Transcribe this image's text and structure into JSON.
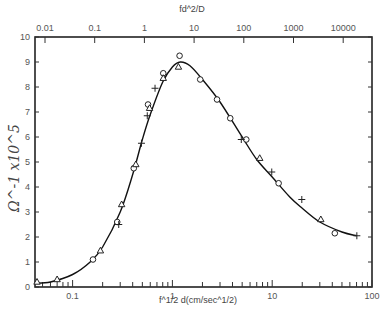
{
  "chart_data": {
    "type": "scatter",
    "title": "",
    "xlabel": "f^1/2 d(cm/sec^1/2)",
    "xlabel_top": "fd^2/D",
    "ylabel": "Ω^-1 x10^5",
    "xscale": "log",
    "xlim": [
      0.042,
      100
    ],
    "ylim": [
      0,
      10
    ],
    "x_ticks_bottom": [
      "0.1",
      "1",
      "10",
      "100"
    ],
    "x_ticks_top": [
      "0.01",
      "0.1",
      "1",
      "10",
      "100",
      "1000",
      "10000"
    ],
    "y_ticks": [
      "0",
      "1",
      "2",
      "3",
      "4",
      "5",
      "6",
      "7",
      "8",
      "9",
      "10"
    ],
    "grid": false,
    "legend": "none",
    "series": [
      {
        "name": "circles",
        "marker": "circle",
        "x": [
          0.16,
          0.28,
          0.41,
          0.57,
          0.81,
          1.18,
          1.9,
          2.8,
          3.8,
          5.5,
          11.6,
          42.4
        ],
        "y": [
          1.1,
          2.6,
          4.75,
          7.3,
          8.55,
          9.25,
          8.3,
          7.5,
          6.75,
          5.9,
          4.15,
          2.15
        ]
      },
      {
        "name": "triangles",
        "marker": "triangle",
        "x": [
          0.044,
          0.07,
          0.19,
          0.31,
          0.43,
          0.59,
          0.81,
          1.15,
          7.5,
          30.7
        ],
        "y": [
          0.2,
          0.3,
          1.45,
          3.3,
          4.9,
          7.15,
          8.35,
          8.8,
          5.15,
          2.7
        ]
      },
      {
        "name": "crosses",
        "marker": "plus",
        "x": [
          0.29,
          0.49,
          0.56,
          0.67,
          4.9,
          9.9,
          19.8,
          70.5
        ],
        "y": [
          2.5,
          5.75,
          6.85,
          7.95,
          5.9,
          4.6,
          3.5,
          2.05
        ]
      },
      {
        "name": "fitted curve",
        "marker": "line",
        "x": [
          0.042,
          0.06,
          0.1,
          0.15,
          0.2,
          0.3,
          0.4,
          0.5,
          0.6,
          0.8,
          1.0,
          1.2,
          1.5,
          2,
          3,
          5,
          7,
          10,
          15,
          20,
          30,
          50,
          70
        ],
        "y": [
          0.15,
          0.2,
          0.5,
          1.0,
          1.6,
          3.0,
          4.5,
          5.9,
          6.9,
          8.2,
          8.8,
          9.0,
          8.85,
          8.3,
          7.4,
          6.0,
          5.1,
          4.4,
          3.6,
          3.15,
          2.6,
          2.2,
          2.05
        ]
      }
    ]
  }
}
